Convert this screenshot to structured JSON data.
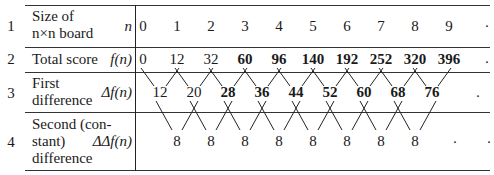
{
  "table": {
    "rows": [
      {
        "number": "1",
        "label_lines": [
          "Size of",
          "n×n board"
        ],
        "symbol": "n"
      },
      {
        "number": "2",
        "label_lines": [
          "Total score"
        ],
        "symbol": "f(n)"
      },
      {
        "number": "3",
        "label_lines": [
          "First",
          "difference"
        ],
        "symbol": "Δf(n)"
      },
      {
        "number": "4",
        "label_lines": [
          "Second (con-",
          "stant)",
          "difference"
        ],
        "symbol": "ΔΔf(n)"
      }
    ],
    "n_values": [
      "0",
      "1",
      "2",
      "3",
      "4",
      "5",
      "6",
      "7",
      "8",
      "9",
      "·"
    ],
    "f_values": [
      "0",
      "12",
      "32",
      "60",
      "96",
      "140",
      "192",
      "252",
      "320",
      "396",
      "·"
    ],
    "first_differences": [
      "12",
      "20",
      "28",
      "36",
      "44",
      "52",
      "60",
      "68",
      "76",
      "·"
    ],
    "second_differences": [
      "8",
      "8",
      "8",
      "8",
      "8",
      "8",
      "8",
      "8",
      "·",
      "·"
    ]
  }
}
